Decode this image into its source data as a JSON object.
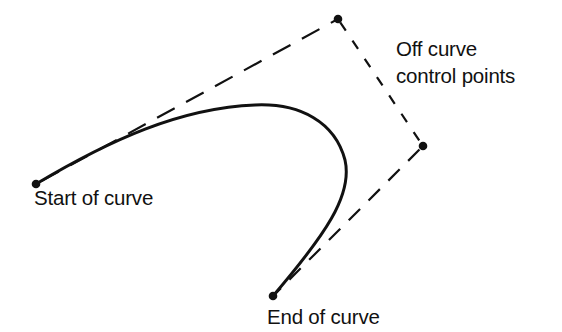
{
  "diagram": {
    "type": "cubic-bezier-illustration",
    "colors": {
      "background": "#ffffff",
      "ink": "#111111"
    },
    "points": {
      "start": {
        "x": 36,
        "y": 184,
        "kind": "on-curve"
      },
      "control1": {
        "x": 338,
        "y": 19,
        "kind": "off-curve"
      },
      "control2": {
        "x": 423,
        "y": 146,
        "kind": "off-curve"
      },
      "end": {
        "x": 273,
        "y": 296,
        "kind": "on-curve"
      }
    },
    "labels": {
      "start": "Start of curve",
      "end": "End of curve",
      "control_line1": "Off curve",
      "control_line2": "control points"
    },
    "control_polygon_style": "dashed",
    "curve_style": "solid"
  }
}
